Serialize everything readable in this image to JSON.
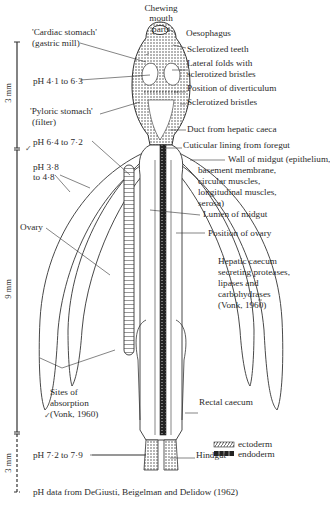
{
  "figure": {
    "top_label": "Chewing mouth parts",
    "left_labels": {
      "cardiac_stomach": "'Cardiac stomach'",
      "cardiac_stomach_sub": "(gastric mill)",
      "ph_foregut": "pH 4·1 to 6·3",
      "pyloric_stomach": "'Pyloric stomach'",
      "pyloric_stomach_sub": "(filter)",
      "ph_midgut": "pH 6·4 to 7·2",
      "ph_caeca_1": "pH 3·8",
      "ph_caeca_2": "to 4·8",
      "ovary": "Ovary",
      "sites_1": "Sites of",
      "sites_2": "absorption",
      "sites_3": "(Vonk, 1960)",
      "ph_hindgut": "pH 7·2 to 7·9"
    },
    "right_labels": {
      "oesophagus": "Oesophagus",
      "sclerotized_teeth": "Sclerotized teeth",
      "lateral_folds_1": "Lateral folds with",
      "lateral_folds_2": "sclerotized bristles",
      "diverticulum": "Position of diverticulum",
      "sclerotized_bristles": "Sclerotized bristles",
      "duct": "Duct from hepatic caeca",
      "cuticular": "Cuticular lining from foregut",
      "wall_1": "Wall of midgut (epithelium,",
      "wall_2": "basement membrane,",
      "wall_3": "circular muscles,",
      "wall_4": "longitudinal muscles,",
      "wall_5": "serosa)",
      "lumen": "Lumen of midgut",
      "position_ovary": "Position of ovary",
      "hepatic_1": "Hepatic caecum",
      "hepatic_2": "secreting proteases,",
      "hepatic_3": "lipases and",
      "hepatic_4": "carbohydrases",
      "hepatic_5": "(Vonk, 1960)",
      "rectal": "Rectal caecum",
      "hindgut": "Hindgut"
    },
    "scale": {
      "foregut": "3 mm",
      "midgut": "9 mm",
      "hindgut": "3 mm"
    },
    "legend": {
      "ectoderm": "ectoderm",
      "endoderm": "endoderm"
    },
    "caption": "pH data from DeGiusti, Beigelman and Delidow (1962)",
    "colors": {
      "ink": "#2b2b2b",
      "background": "#ffffff"
    }
  }
}
